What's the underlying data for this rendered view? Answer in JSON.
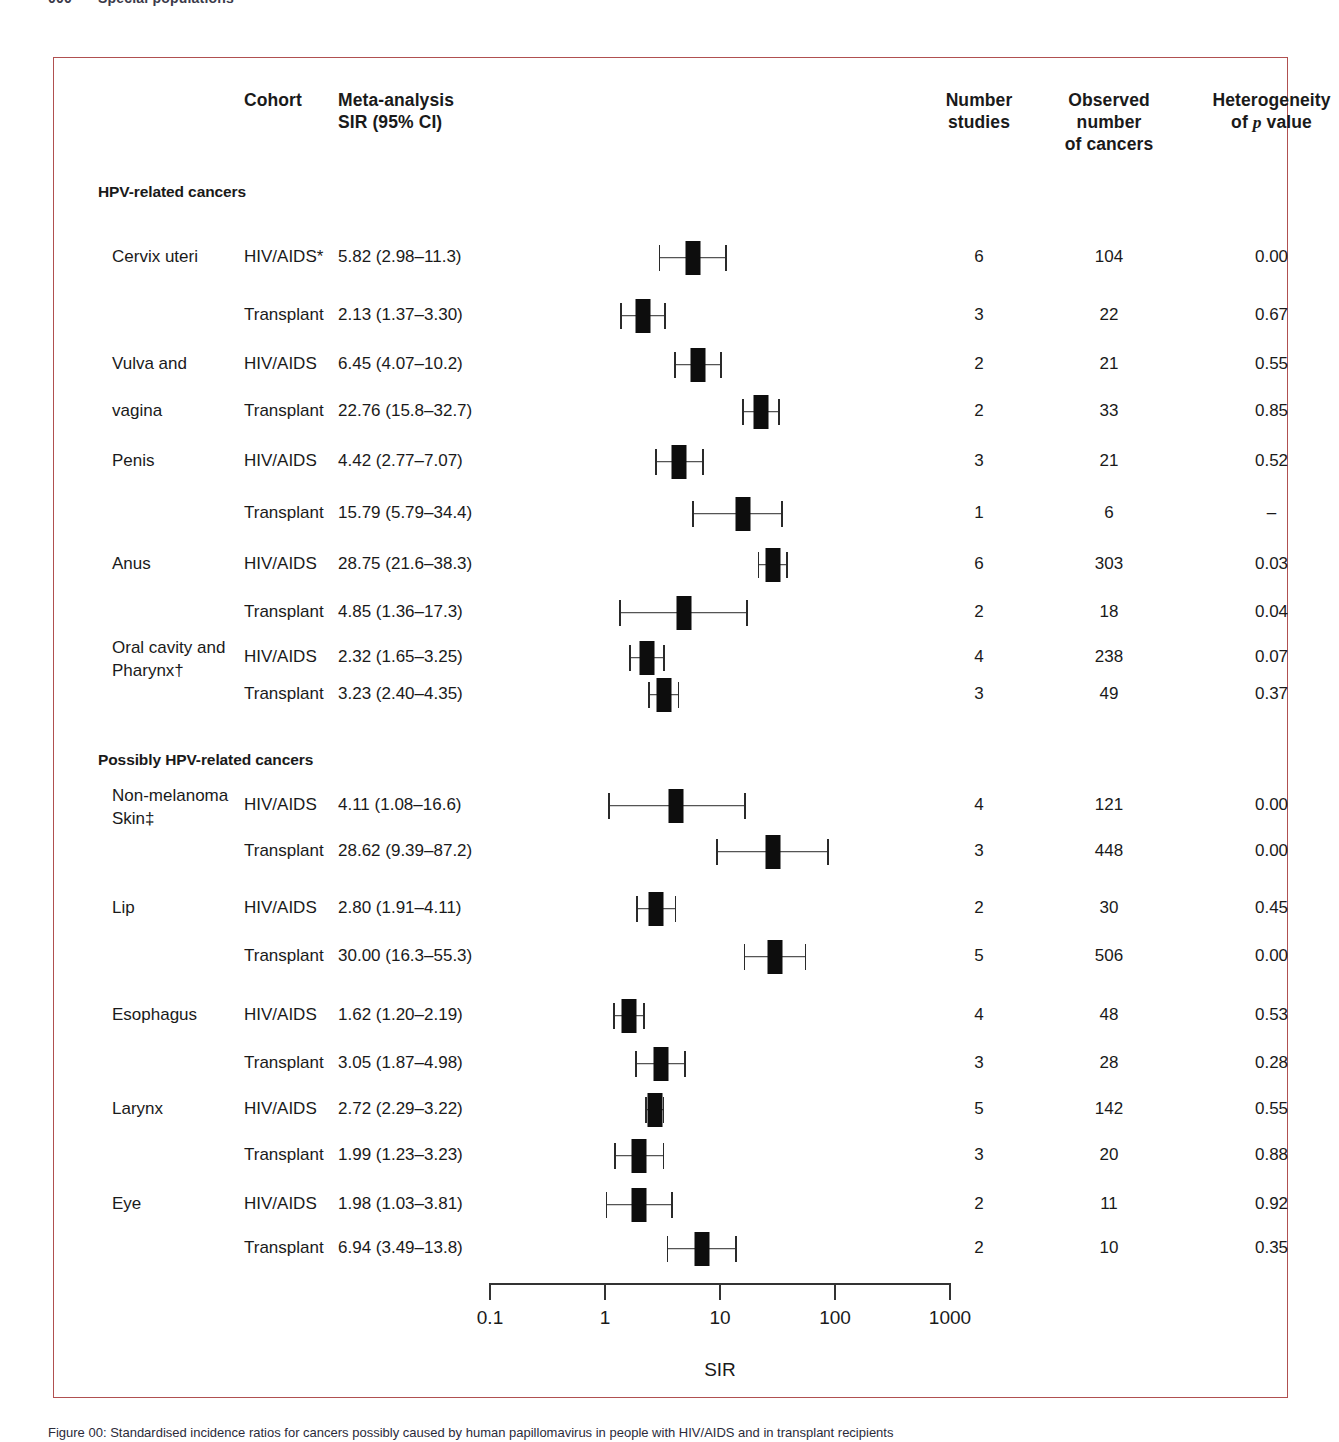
{
  "running_head": {
    "folio": "000",
    "text": "Special populations"
  },
  "frame": {
    "border_color": "#b05050"
  },
  "headers": {
    "cohort": "Cohort",
    "estimate_line1": "Meta-analysis",
    "estimate_line2": "SIR (95% CI)",
    "studies_line1": "Number",
    "studies_line2": "studies",
    "observed_line1": "Observed",
    "observed_line2": "number",
    "observed_line3": "of cancers",
    "heterogeneity_line1": "Heterogeneity",
    "heterogeneity_line2": "of p value"
  },
  "sections": [
    {
      "title": "HPV-related cancers"
    },
    {
      "title": "Possibly HPV-related cancers"
    }
  ],
  "axis": {
    "title": "SIR",
    "ticks": [
      "0.1",
      "1",
      "10",
      "100",
      "1000"
    ],
    "tick_values": [
      0.1,
      1,
      10,
      100,
      1000
    ],
    "scale": "log10",
    "min": 0.1,
    "max": 1000
  },
  "caption": "Figure 00: Standardised incidence ratios for cancers possibly caused by human papillomavirus in people with HIV/AIDS and in transplant recipients",
  "chart_data": {
    "type": "forest",
    "title": "",
    "xlabel": "SIR",
    "ylabel": "",
    "xscale": "log",
    "xlim": [
      0.1,
      1000
    ],
    "xticks": [
      0.1,
      1,
      10,
      100,
      1000
    ],
    "xticklabels": [
      "0.1",
      "1",
      "10",
      "100",
      "1000"
    ],
    "grid": false,
    "columns": [
      "Cancer site",
      "Cohort",
      "Meta-analysis SIR (95% CI)",
      "Number studies",
      "Observed number of cancers",
      "Heterogeneity of p value"
    ],
    "groups": [
      {
        "section": "HPV-related cancers",
        "rows": [
          {
            "site": "Cervix uteri",
            "site_line2": "",
            "cohort": "HIV/AIDS*",
            "estimate_text": "5.82 (2.98–11.3)",
            "sir": 5.82,
            "ci_low": 2.98,
            "ci_high": 11.3,
            "studies": "6",
            "observed": "104",
            "p_value": "0.00"
          },
          {
            "site": "",
            "site_line2": "",
            "cohort": "Transplant",
            "estimate_text": "2.13 (1.37–3.30)",
            "sir": 2.13,
            "ci_low": 1.37,
            "ci_high": 3.3,
            "studies": "3",
            "observed": "22",
            "p_value": "0.67"
          },
          {
            "site": "Vulva and",
            "site_line2": "",
            "cohort": "HIV/AIDS",
            "estimate_text": "6.45 (4.07–10.2)",
            "sir": 6.45,
            "ci_low": 4.07,
            "ci_high": 10.2,
            "studies": "2",
            "observed": "21",
            "p_value": "0.55"
          },
          {
            "site": "vagina",
            "site_line2": "",
            "cohort": "Transplant",
            "estimate_text": "22.76 (15.8–32.7)",
            "sir": 22.76,
            "ci_low": 15.8,
            "ci_high": 32.7,
            "studies": "2",
            "observed": "33",
            "p_value": "0.85"
          },
          {
            "site": "Penis",
            "site_line2": "",
            "cohort": "HIV/AIDS",
            "estimate_text": "4.42 (2.77–7.07)",
            "sir": 4.42,
            "ci_low": 2.77,
            "ci_high": 7.07,
            "studies": "3",
            "observed": "21",
            "p_value": "0.52"
          },
          {
            "site": "",
            "site_line2": "",
            "cohort": "Transplant",
            "estimate_text": "15.79 (5.79–34.4)",
            "sir": 15.79,
            "ci_low": 5.79,
            "ci_high": 34.4,
            "studies": "1",
            "observed": "6",
            "p_value": "–"
          },
          {
            "site": "Anus",
            "site_line2": "",
            "cohort": "HIV/AIDS",
            "estimate_text": "28.75 (21.6–38.3)",
            "sir": 28.75,
            "ci_low": 21.6,
            "ci_high": 38.3,
            "studies": "6",
            "observed": "303",
            "p_value": "0.03"
          },
          {
            "site": "",
            "site_line2": "",
            "cohort": "Transplant",
            "estimate_text": "4.85 (1.36–17.3)",
            "sir": 4.85,
            "ci_low": 1.36,
            "ci_high": 17.3,
            "studies": "2",
            "observed": "18",
            "p_value": "0.04"
          },
          {
            "site": "Oral cavity and",
            "site_line2": "Pharynx†",
            "cohort": "HIV/AIDS",
            "estimate_text": "2.32 (1.65–3.25)",
            "sir": 2.32,
            "ci_low": 1.65,
            "ci_high": 3.25,
            "studies": "4",
            "observed": "238",
            "p_value": "0.07"
          },
          {
            "site": "",
            "site_line2": "",
            "cohort": "Transplant",
            "estimate_text": "3.23 (2.40–4.35)",
            "sir": 3.23,
            "ci_low": 2.4,
            "ci_high": 4.35,
            "studies": "3",
            "observed": "49",
            "p_value": "0.37"
          }
        ]
      },
      {
        "section": "Possibly HPV-related cancers",
        "rows": [
          {
            "site": "Non-melanoma",
            "site_line2": "Skin‡",
            "cohort": "HIV/AIDS",
            "estimate_text": "4.11 (1.08–16.6)",
            "sir": 4.11,
            "ci_low": 1.08,
            "ci_high": 16.6,
            "studies": "4",
            "observed": "121",
            "p_value": "0.00"
          },
          {
            "site": "",
            "site_line2": "",
            "cohort": "Transplant",
            "estimate_text": "28.62 (9.39–87.2)",
            "sir": 28.62,
            "ci_low": 9.39,
            "ci_high": 87.2,
            "studies": "3",
            "observed": "448",
            "p_value": "0.00"
          },
          {
            "site": "Lip",
            "site_line2": "",
            "cohort": "HIV/AIDS",
            "estimate_text": "2.80 (1.91–4.11)",
            "sir": 2.8,
            "ci_low": 1.91,
            "ci_high": 4.11,
            "studies": "2",
            "observed": "30",
            "p_value": "0.45"
          },
          {
            "site": "",
            "site_line2": "",
            "cohort": "Transplant",
            "estimate_text": "30.00 (16.3–55.3)",
            "sir": 30.0,
            "ci_low": 16.3,
            "ci_high": 55.3,
            "studies": "5",
            "observed": "506",
            "p_value": "0.00"
          },
          {
            "site": "Esophagus",
            "site_line2": "",
            "cohort": "HIV/AIDS",
            "estimate_text": "1.62 (1.20–2.19)",
            "sir": 1.62,
            "ci_low": 1.2,
            "ci_high": 2.19,
            "studies": "4",
            "observed": "48",
            "p_value": "0.53"
          },
          {
            "site": "",
            "site_line2": "",
            "cohort": "Transplant",
            "estimate_text": "3.05 (1.87–4.98)",
            "sir": 3.05,
            "ci_low": 1.87,
            "ci_high": 4.98,
            "studies": "3",
            "observed": "28",
            "p_value": "0.28"
          },
          {
            "site": "Larynx",
            "site_line2": "",
            "cohort": "HIV/AIDS",
            "estimate_text": "2.72 (2.29–3.22)",
            "sir": 2.72,
            "ci_low": 2.29,
            "ci_high": 3.22,
            "studies": "5",
            "observed": "142",
            "p_value": "0.55"
          },
          {
            "site": "",
            "site_line2": "",
            "cohort": "Transplant",
            "estimate_text": "1.99 (1.23–3.23)",
            "sir": 1.99,
            "ci_low": 1.23,
            "ci_high": 3.23,
            "studies": "3",
            "observed": "20",
            "p_value": "0.88"
          },
          {
            "site": "Eye",
            "site_line2": "",
            "cohort": "HIV/AIDS",
            "estimate_text": "1.98 (1.03–3.81)",
            "sir": 1.98,
            "ci_low": 1.03,
            "ci_high": 3.81,
            "studies": "2",
            "observed": "11",
            "p_value": "0.92"
          },
          {
            "site": "",
            "site_line2": "",
            "cohort": "Transplant",
            "estimate_text": "6.94 (3.49–13.8)",
            "sir": 6.94,
            "ci_low": 3.49,
            "ci_high": 13.8,
            "studies": "2",
            "observed": "10",
            "p_value": "0.35"
          }
        ]
      }
    ]
  }
}
